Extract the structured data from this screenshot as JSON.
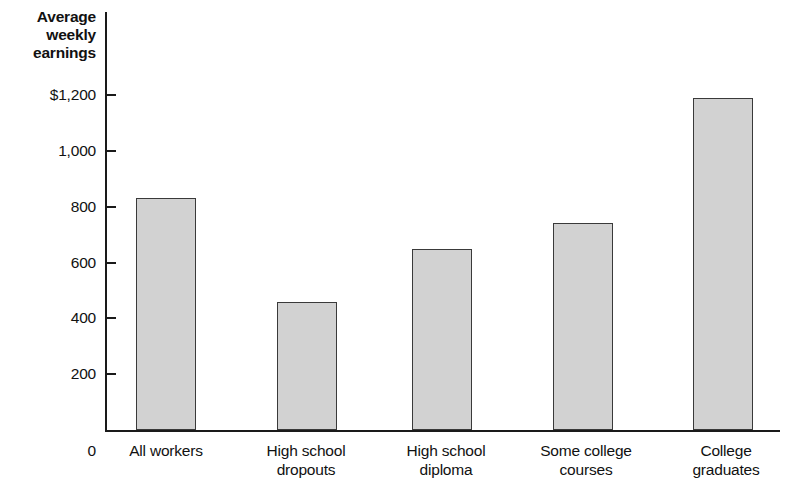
{
  "chart_data": {
    "type": "bar",
    "title": "Average weekly earnings",
    "xlabel": "",
    "ylabel": "Average weekly earnings",
    "categories": [
      "All workers",
      "High school dropouts",
      "High school diploma",
      "Some college courses",
      "College graduates"
    ],
    "category_lines": [
      "All workers",
      "High school\ndropouts",
      "High school\ndiploma",
      "Some college\ncourses",
      "College\ngraduates"
    ],
    "values": [
      830,
      460,
      650,
      740,
      1190
    ],
    "ylim": [
      0,
      1260
    ],
    "yticks": [
      200,
      400,
      600,
      800,
      1000,
      1200
    ],
    "ytick_labels": [
      "200",
      "400",
      "600",
      "800",
      "1,000",
      "$1,200"
    ],
    "zero_label": "0",
    "grid": false,
    "legend": false,
    "bar_fill_color": "#d2d2d2",
    "bar_edge_color": "#3a3a3a",
    "axis_color": "#1a1a1a",
    "background_color": "#ffffff"
  }
}
